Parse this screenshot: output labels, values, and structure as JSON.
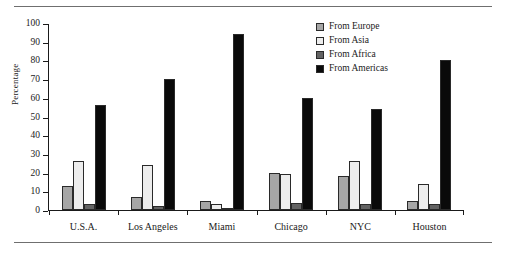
{
  "chart_data": {
    "type": "bar",
    "title": "",
    "xlabel": "",
    "ylabel": "Percentage",
    "ylim": [
      0,
      100
    ],
    "yticks": [
      0,
      10,
      20,
      30,
      40,
      50,
      60,
      70,
      80,
      90,
      100
    ],
    "grid": false,
    "legend_position": "top-right",
    "categories": [
      "U.S.A.",
      "Los Angeles",
      "Miami",
      "Chicago",
      "NYC",
      "Houston"
    ],
    "series": [
      {
        "name": "From Europe",
        "color": "#a6a6a6",
        "values": [
          13,
          7,
          5,
          20,
          18,
          5
        ]
      },
      {
        "name": "From Asia",
        "color": "#ededed",
        "values": [
          26,
          24,
          3,
          19,
          26,
          14
        ]
      },
      {
        "name": "From Africa",
        "color": "#636363",
        "values": [
          3,
          2,
          1,
          4,
          3,
          3
        ]
      },
      {
        "name": "From Americas",
        "color": "#0a0a0a",
        "values": [
          56,
          70,
          94,
          60,
          54,
          80
        ]
      }
    ]
  },
  "axis": {
    "y_label": "Percentage",
    "y_tick_labels": [
      "100",
      "90",
      "80",
      "70",
      "60",
      "50",
      "40",
      "30",
      "20",
      "10",
      "0"
    ]
  },
  "legend": {
    "items": [
      {
        "label": "From Europe"
      },
      {
        "label": "From Asia"
      },
      {
        "label": "From Africa"
      },
      {
        "label": "From Americas"
      }
    ]
  },
  "x_categories": [
    "U.S.A.",
    "Los Angeles",
    "Miami",
    "Chicago",
    "NYC",
    "Houston"
  ],
  "colors": {
    "europe": "#a6a6a6",
    "asia": "#ededed",
    "africa": "#636363",
    "americas": "#0a0a0a",
    "axis": "#1a1a1a",
    "rule": "#6f6f6f"
  }
}
